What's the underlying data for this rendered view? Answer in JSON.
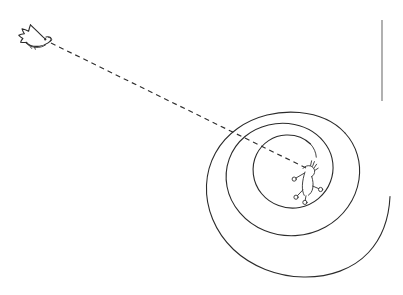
{
  "canvas": {
    "width": 403,
    "height": 295,
    "background_color": "#ffffff",
    "ink_color": "#2b2b2b",
    "rule_color": "#707070",
    "title": "Bird flying toward a spiral"
  },
  "figures": {
    "bird": {
      "name": "bird",
      "label": "bird",
      "position_x": 33,
      "position_y": 36,
      "facing": "right",
      "eye_color": "#2b2b2b"
    },
    "trajectory": {
      "name": "dashed-trajectory",
      "label": "dashed flight path",
      "start_x": 51,
      "start_y": 43,
      "end_x": 306,
      "end_y": 168,
      "dash_pattern": "5 4",
      "color": "#2e2e2e"
    },
    "spiral": {
      "name": "spiral",
      "label": "spiral",
      "center_x": 295,
      "center_y": 190,
      "turns": 3,
      "outer_radius": 96,
      "inner_radius": 33,
      "color": "#2b2b2b"
    },
    "center_creature": {
      "name": "center-creature",
      "label": "small figure at spiral center",
      "position_x": 304,
      "position_y": 183,
      "color": "#2b2b2b"
    },
    "vertical_rule": {
      "name": "vertical-rule",
      "label": "vertical margin rule",
      "x": 382,
      "y_start": 20,
      "y_end": 101,
      "color": "#707070"
    }
  }
}
